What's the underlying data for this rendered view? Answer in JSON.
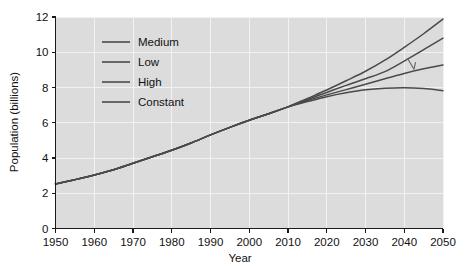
{
  "chart_data": {
    "type": "line",
    "title": "",
    "subtitle": "",
    "xlabel": "Year",
    "ylabel": "Population (billions)",
    "xlim": [
      1950,
      2050
    ],
    "ylim": [
      0,
      12
    ],
    "grid": true,
    "legend_position": "upper-left-inside",
    "x_ticks": [
      1950,
      1960,
      1970,
      1980,
      1990,
      2000,
      2010,
      2020,
      2030,
      2040,
      2050
    ],
    "x_tick_labels": [
      "1950",
      "1960",
      "1970",
      "1980",
      "1990",
      "2000",
      "2010",
      "2020",
      "2030",
      "2040",
      "2050"
    ],
    "y_ticks": [
      0,
      2,
      4,
      6,
      8,
      10,
      12
    ],
    "y_tick_labels": [
      "0",
      "2",
      "4",
      "6",
      "8",
      "10",
      "12"
    ],
    "x": [
      1950,
      1955,
      1960,
      1965,
      1970,
      1975,
      1980,
      1985,
      1990,
      1995,
      2000,
      2005,
      2010,
      2015,
      2020,
      2025,
      2030,
      2035,
      2040,
      2045,
      2050
    ],
    "series": [
      {
        "name": "Medium",
        "color": "#4a4a4a",
        "values": [
          2.53,
          2.77,
          3.03,
          3.33,
          3.7,
          4.07,
          4.44,
          4.85,
          5.31,
          5.74,
          6.14,
          6.51,
          6.9,
          7.32,
          7.72,
          8.12,
          8.5,
          8.9,
          9.5,
          10.15,
          10.8
        ]
      },
      {
        "name": "Low",
        "color": "#4a4a4a",
        "values": [
          2.53,
          2.77,
          3.03,
          3.33,
          3.7,
          4.07,
          4.44,
          4.85,
          5.31,
          5.74,
          6.14,
          6.51,
          6.9,
          7.26,
          7.58,
          7.88,
          8.18,
          8.5,
          8.8,
          9.06,
          9.28
        ]
      },
      {
        "name": "High",
        "color": "#4a4a4a",
        "values": [
          2.53,
          2.77,
          3.03,
          3.33,
          3.7,
          4.07,
          4.44,
          4.85,
          5.31,
          5.74,
          6.14,
          6.51,
          6.9,
          7.38,
          7.86,
          8.38,
          8.92,
          9.55,
          10.28,
          11.05,
          11.88
        ]
      },
      {
        "name": "Constant",
        "color": "#4a4a4a",
        "values": [
          2.53,
          2.77,
          3.03,
          3.33,
          3.7,
          4.07,
          4.44,
          4.85,
          5.31,
          5.74,
          6.14,
          6.51,
          6.9,
          7.2,
          7.48,
          7.7,
          7.87,
          7.96,
          7.99,
          7.94,
          7.82
        ]
      }
    ],
    "annotations": [
      {
        "name": "pointer-mark",
        "x": 2042,
        "y": 9.55
      }
    ]
  },
  "legend": {
    "items": [
      {
        "label": "Medium"
      },
      {
        "label": "Low"
      },
      {
        "label": "High"
      },
      {
        "label": "Constant"
      }
    ]
  }
}
